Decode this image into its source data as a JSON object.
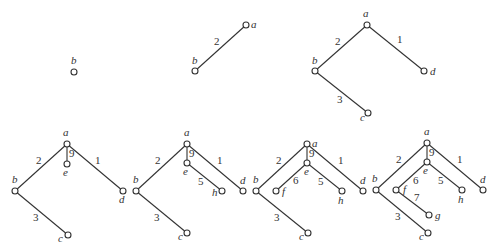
{
  "figure": {
    "panels": [
      {
        "id": 1,
        "nodes": [
          {
            "id": "b",
            "x": 74,
            "y": 72,
            "lx": 71,
            "ly": 64
          }
        ],
        "edges": []
      },
      {
        "id": 2,
        "nodes": [
          {
            "id": "a",
            "x": 246,
            "y": 25,
            "lx": 251,
            "ly": 28
          },
          {
            "id": "b",
            "x": 195,
            "y": 71,
            "lx": 192,
            "ly": 64
          }
        ],
        "edges": [
          {
            "from": "a",
            "to": "b",
            "weight": "2",
            "wx": 214,
            "wy": 45
          }
        ]
      },
      {
        "id": 3,
        "nodes": [
          {
            "id": "a",
            "x": 367,
            "y": 25,
            "lx": 363,
            "ly": 17
          },
          {
            "id": "b",
            "x": 315,
            "y": 71,
            "lx": 312,
            "ly": 64
          },
          {
            "id": "d",
            "x": 424,
            "y": 71,
            "lx": 430,
            "ly": 75
          },
          {
            "id": "c",
            "x": 368,
            "y": 113,
            "lx": 360,
            "ly": 121
          }
        ],
        "edges": [
          {
            "from": "a",
            "to": "b",
            "weight": "2",
            "wx": 335,
            "wy": 45
          },
          {
            "from": "a",
            "to": "d",
            "weight": "1",
            "wx": 397,
            "wy": 43
          },
          {
            "from": "b",
            "to": "c",
            "weight": "3",
            "wx": 337,
            "wy": 103
          }
        ]
      },
      {
        "id": 4,
        "nodes": [
          {
            "id": "a",
            "x": 67,
            "y": 144,
            "lx": 63,
            "ly": 136
          },
          {
            "id": "e",
            "x": 67,
            "y": 164,
            "lx": 63,
            "ly": 176
          },
          {
            "id": "b",
            "x": 15,
            "y": 191,
            "lx": 12,
            "ly": 183
          },
          {
            "id": "d",
            "x": 123,
            "y": 191,
            "lx": 119,
            "ly": 203
          },
          {
            "id": "c",
            "x": 68,
            "y": 235,
            "lx": 58,
            "ly": 242
          }
        ],
        "edges": [
          {
            "from": "a",
            "to": "e",
            "weight": "9",
            "wx": 69,
            "wy": 157
          },
          {
            "from": "a",
            "to": "b",
            "weight": "2",
            "wx": 36,
            "wy": 164
          },
          {
            "from": "a",
            "to": "d",
            "weight": "1",
            "wx": 95,
            "wy": 164
          },
          {
            "from": "b",
            "to": "c",
            "weight": "3",
            "wx": 33,
            "wy": 221
          }
        ]
      },
      {
        "id": 5,
        "nodes": [
          {
            "id": "a",
            "x": 187,
            "y": 144,
            "lx": 184,
            "ly": 136
          },
          {
            "id": "e",
            "x": 187,
            "y": 163,
            "lx": 183,
            "ly": 175
          },
          {
            "id": "h",
            "x": 222,
            "y": 191,
            "lx": 212,
            "ly": 196
          },
          {
            "id": "b",
            "x": 136,
            "y": 191,
            "lx": 133,
            "ly": 183
          },
          {
            "id": "d",
            "x": 243,
            "y": 191,
            "lx": 240,
            "ly": 184
          },
          {
            "id": "c",
            "x": 187,
            "y": 233,
            "lx": 178,
            "ly": 240
          }
        ],
        "edges": [
          {
            "from": "a",
            "to": "e",
            "weight": "9",
            "wx": 189,
            "wy": 157
          },
          {
            "from": "a",
            "to": "b",
            "weight": "2",
            "wx": 155,
            "wy": 164
          },
          {
            "from": "a",
            "to": "d",
            "weight": "1",
            "wx": 217,
            "wy": 164
          },
          {
            "from": "e",
            "to": "h",
            "weight": "5",
            "wx": 198,
            "wy": 185
          },
          {
            "from": "b",
            "to": "c",
            "weight": "3",
            "wx": 154,
            "wy": 221
          }
        ]
      },
      {
        "id": 6,
        "nodes": [
          {
            "id": "a",
            "x": 307,
            "y": 144,
            "lx": 312,
            "ly": 147
          },
          {
            "id": "e",
            "x": 307,
            "y": 163,
            "lx": 304,
            "ly": 175
          },
          {
            "id": "f",
            "x": 276,
            "y": 191,
            "lx": 282,
            "ly": 195
          },
          {
            "id": "h",
            "x": 342,
            "y": 191,
            "lx": 338,
            "ly": 204
          },
          {
            "id": "b",
            "x": 256,
            "y": 191,
            "lx": 253,
            "ly": 183
          },
          {
            "id": "d",
            "x": 363,
            "y": 191,
            "lx": 360,
            "ly": 184
          },
          {
            "id": "c",
            "x": 308,
            "y": 233,
            "lx": 299,
            "ly": 240
          }
        ],
        "edges": [
          {
            "from": "a",
            "to": "e",
            "weight": "9",
            "wx": 309,
            "wy": 157
          },
          {
            "from": "a",
            "to": "b",
            "weight": "2",
            "wx": 276,
            "wy": 164
          },
          {
            "from": "a",
            "to": "d",
            "weight": "1",
            "wx": 338,
            "wy": 164
          },
          {
            "from": "e",
            "to": "f",
            "weight": "6",
            "wx": 293,
            "wy": 184
          },
          {
            "from": "e",
            "to": "h",
            "weight": "5",
            "wx": 318,
            "wy": 185
          },
          {
            "from": "b",
            "to": "c",
            "weight": "3",
            "wx": 274,
            "wy": 221
          }
        ]
      },
      {
        "id": 7,
        "nodes": [
          {
            "id": "a",
            "x": 427,
            "y": 143,
            "lx": 424,
            "ly": 135
          },
          {
            "id": "e",
            "x": 427,
            "y": 162,
            "lx": 423,
            "ly": 174
          },
          {
            "id": "b",
            "x": 376,
            "y": 190,
            "lx": 372,
            "ly": 182
          },
          {
            "id": "f",
            "x": 396,
            "y": 190,
            "lx": 403,
            "ly": 193
          },
          {
            "id": "h",
            "x": 462,
            "y": 190,
            "lx": 458,
            "ly": 203
          },
          {
            "id": "d",
            "x": 483,
            "y": 190,
            "lx": 480,
            "ly": 183
          },
          {
            "id": "g",
            "x": 429,
            "y": 215,
            "lx": 435,
            "ly": 219
          },
          {
            "id": "c",
            "x": 428,
            "y": 233,
            "lx": 419,
            "ly": 240
          }
        ],
        "edges": [
          {
            "from": "a",
            "to": "e",
            "weight": "9",
            "wx": 429,
            "wy": 156
          },
          {
            "from": "a",
            "to": "b",
            "weight": "2",
            "wx": 396,
            "wy": 163
          },
          {
            "from": "a",
            "to": "d",
            "weight": "1",
            "wx": 457,
            "wy": 163
          },
          {
            "from": "e",
            "to": "f",
            "weight": "6",
            "wx": 413,
            "wy": 184
          },
          {
            "from": "e",
            "to": "h",
            "weight": "5",
            "wx": 438,
            "wy": 184
          },
          {
            "from": "f",
            "to": "g",
            "weight": "7",
            "wx": 414,
            "wy": 201
          },
          {
            "from": "b",
            "to": "c",
            "weight": "3",
            "wx": 395,
            "wy": 220
          }
        ]
      }
    ]
  }
}
